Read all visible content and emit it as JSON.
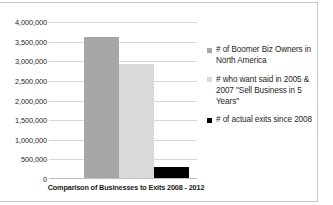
{
  "chart_data": {
    "type": "bar",
    "title": "",
    "xlabel": "Comparison of Businesses to Exits 2008 - 2012",
    "ylabel": "",
    "ylim": [
      0,
      4000000
    ],
    "grid": true,
    "legend_position": "right",
    "categories": [
      "Comparison of Businesses to Exits 2008 - 2012"
    ],
    "ytick_labels": [
      "4,000,000",
      "3,500,000",
      "3,000,000",
      "2,500,000",
      "2,000,000",
      "1,500,000",
      "1,000,000",
      "500,000",
      "0"
    ],
    "ytick_values": [
      4000000,
      3500000,
      3000000,
      2500000,
      2000000,
      1500000,
      1000000,
      500000,
      0
    ],
    "series": [
      {
        "name": "# of Boomer Biz Owners in North America",
        "values": [
          3600000
        ],
        "color": "#a6a6a6"
      },
      {
        "name": "# who want said in 2005 & 2007 \"Sell Business in 5 Years\"",
        "values": [
          2900000
        ],
        "color": "#d9d9d9"
      },
      {
        "name": "# of actual exits since 2008",
        "values": [
          290000
        ],
        "color": "#000000"
      }
    ]
  },
  "legend": {
    "items": [
      {
        "label": "# of Boomer Biz Owners in North America",
        "color": "#a6a6a6"
      },
      {
        "label": "# who want said in 2005 & 2007 \"Sell Business in 5 Years\"",
        "color": "#d9d9d9"
      },
      {
        "label": "# of actual exits since 2008",
        "color": "#000000"
      }
    ]
  },
  "axis": {
    "x_title": "Comparison of Businesses to Exits 2008 - 2012"
  }
}
